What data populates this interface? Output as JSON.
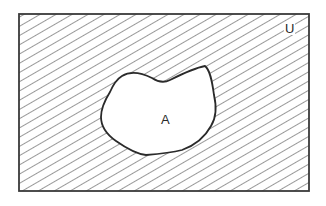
{
  "diagram": {
    "type": "venn",
    "title": "",
    "universal_set": {
      "label": "U",
      "shape": "rectangle",
      "shaded": true,
      "shading": "diagonal-hatch"
    },
    "sets": [
      {
        "label": "A",
        "shape": "irregular-blob",
        "shaded": false
      }
    ],
    "shaded_region": "complement of A (U \\ A)",
    "colors": {
      "stroke": "#2a2a2a",
      "hatch": "#555555",
      "background": "#ffffff"
    }
  }
}
